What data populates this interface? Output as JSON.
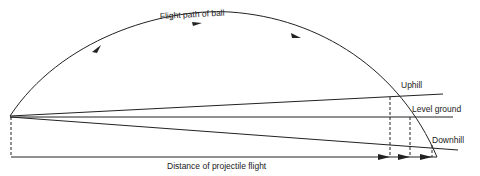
{
  "diagram": {
    "title_label": "Flight path of ball",
    "lines": [
      {
        "name": "uphill",
        "label": "Uphill"
      },
      {
        "name": "level-ground",
        "label": "Level ground"
      },
      {
        "name": "downhill",
        "label": "Downhill"
      }
    ],
    "distance_label": "Distance of projectile flight",
    "colors": {
      "stroke": "#222222",
      "background": "#ffffff"
    }
  }
}
